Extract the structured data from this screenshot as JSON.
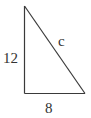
{
  "diagram": {
    "type": "right-triangle",
    "labels": {
      "vertical_leg": "12",
      "horizontal_leg": "8",
      "hypotenuse": "c"
    },
    "stroke_color": "#3a3a3a",
    "text_color": "#333333"
  }
}
